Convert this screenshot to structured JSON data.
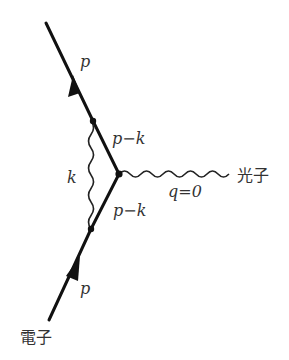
{
  "diagram": {
    "type": "feynman-diagram",
    "colors": {
      "line": "#111111",
      "text": "#333333",
      "background": "#ffffff"
    },
    "labels": {
      "incoming_electron": "電子",
      "outgoing_photon": "光子",
      "incoming_momentum": "p",
      "outgoing_momentum": "p",
      "upper_internal_momentum": "p−k",
      "lower_internal_momentum": "p−k",
      "virtual_photon_momentum": "k",
      "external_photon_momentum": "q=0"
    },
    "vertices": [
      {
        "name": "upper-vertex",
        "x": 93,
        "y": 121
      },
      {
        "name": "central-vertex",
        "x": 119,
        "y": 174
      },
      {
        "name": "lower-vertex",
        "x": 91,
        "y": 229
      }
    ],
    "lines": [
      {
        "name": "outgoing-electron",
        "kind": "fermion",
        "from": [
          46,
          23
        ],
        "to": [
          93,
          121
        ]
      },
      {
        "name": "upper-internal-electron",
        "kind": "fermion",
        "from": [
          93,
          121
        ],
        "to": [
          119,
          174
        ]
      },
      {
        "name": "lower-internal-electron",
        "kind": "fermion",
        "from": [
          91,
          229
        ],
        "to": [
          119,
          174
        ]
      },
      {
        "name": "incoming-electron",
        "kind": "fermion",
        "from": [
          49,
          320
        ],
        "to": [
          91,
          229
        ]
      },
      {
        "name": "virtual-photon",
        "kind": "photon",
        "from": [
          91,
          229
        ],
        "to": [
          92,
          121
        ]
      },
      {
        "name": "external-photon",
        "kind": "photon",
        "from": [
          119,
          174
        ],
        "to": [
          230,
          174
        ]
      }
    ]
  }
}
